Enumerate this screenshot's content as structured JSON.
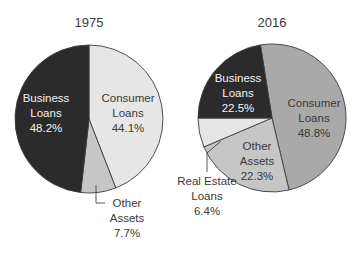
{
  "chart_data": [
    {
      "type": "pie",
      "title": "1975",
      "start_angle_deg": 0,
      "direction": "clockwise",
      "slices": [
        {
          "label": "Consumer Loans",
          "value": 44.1,
          "display": "44.1%",
          "color": "#e6e6e6"
        },
        {
          "label": "Other Assets",
          "value": 7.7,
          "display": "7.7%",
          "color": "#c6c6c6"
        },
        {
          "label": "Business Loans",
          "value": 48.2,
          "display": "48.2%",
          "color": "#2b2b2b"
        }
      ]
    },
    {
      "type": "pie",
      "title": "2016",
      "start_angle_deg": -9,
      "direction": "clockwise",
      "slices": [
        {
          "label": "Consumer Loans",
          "value": 48.8,
          "display": "48.8%",
          "color": "#a9a9a9"
        },
        {
          "label": "Other Assets",
          "value": 22.3,
          "display": "22.3%",
          "color": "#c6c6c6"
        },
        {
          "label": "Real Estate Loans",
          "value": 6.4,
          "display": "6.4%",
          "color": "#e6e6e6"
        },
        {
          "label": "Business Loans",
          "value": 22.5,
          "display": "22.5%",
          "color": "#2b2b2b"
        }
      ]
    }
  ],
  "charts": {
    "left": {
      "year": "1975",
      "business": {
        "line1": "Business",
        "line2": "Loans",
        "pct": "48.2%"
      },
      "consumer": {
        "line1": "Consumer",
        "line2": "Loans",
        "pct": "44.1%"
      },
      "other": {
        "line1": "Other",
        "line2": "Assets",
        "pct": "7.7%"
      }
    },
    "right": {
      "year": "2016",
      "business": {
        "line1": "Business",
        "line2": "Loans",
        "pct": "22.5%"
      },
      "consumer": {
        "line1": "Consumer",
        "line2": "Loans",
        "pct": "48.8%"
      },
      "other": {
        "line1": "Other",
        "line2": "Assets",
        "pct": "22.3%"
      },
      "real_estate": {
        "line1": "Real Estate",
        "line2": "Loans",
        "pct": "6.4%"
      }
    }
  }
}
